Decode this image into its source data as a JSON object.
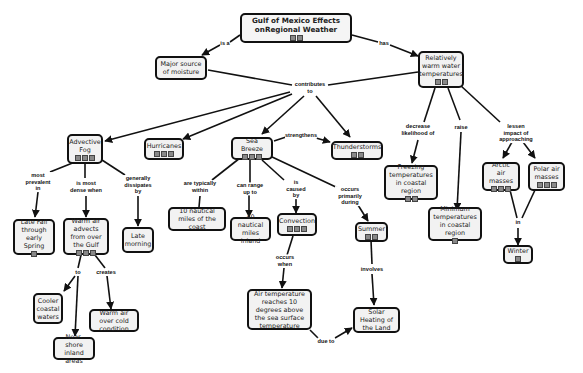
{
  "title": "Gulf of Mexico Effects onRegional Weather",
  "nodes": {
    "root": "Gulf of Mexico Effects onRegional Weather",
    "moisture": "Major source of moisture",
    "warm_water": "Relatively warm water temperatures",
    "fog": "Advective Fog",
    "hurricanes": "Hurricanes",
    "sea_breeze": "Sea Breeze",
    "thunderstorms": "Thunderstorms",
    "freezing": "Freezing temperatures in coastal region",
    "minimum": "Minimum temperatures in coastal region",
    "arctic": "Arctic air masses",
    "polar": "Polar air masses",
    "winter": "Winter",
    "late_fall": "Late Fall through early Spring",
    "warm_air": "Warm air advects from over the Gulf",
    "late_morning": "Late morning",
    "ten_nm": "10 nautical miles of the coast",
    "forty_nm": "40 nautical miles inland",
    "convection": "Convection",
    "summer": "Summer",
    "cooler": "Cooler coastal waters",
    "nearshore": "Near-shore inland areas",
    "warm_over_cold": "Warm air over cold condition",
    "air_temp": "Air temperature reaches 10 degrees above the sea surface temperature",
    "solar": "Solar Heating of the Land"
  },
  "links": {
    "is_a": "is a",
    "has": "has",
    "contributes_to": "contributes to",
    "strengthens": "strengthens",
    "decrease": "decrease likelihood of",
    "raise": "raise",
    "lessen": "lessen impact of approaching",
    "in": "in",
    "most_prevalent": "most prevalent in",
    "most_dense": "is most dense when",
    "dissipates": "generally dissipates by",
    "typically_within": "are typically within",
    "range_up": "can range up to",
    "caused_by": "is caused by",
    "occurs_during": "occurs primarily during",
    "to": "to",
    "creates": "creates",
    "occurs_when": "occurs when",
    "involves": "involves",
    "due_to": "due to"
  },
  "node_icons": {
    "root": [
      "doc-icon",
      "concept-map-icon"
    ],
    "warm_water": [
      "image-icon",
      "concept-map-icon"
    ],
    "fog": [
      "image-icon",
      "doc-icon",
      "concept-map-icon"
    ],
    "hurricanes": [
      "image-icon",
      "doc-icon",
      "concept-map-icon"
    ],
    "sea_breeze": [
      "image-icon",
      "doc-icon",
      "concept-map-icon"
    ],
    "thunderstorms": [
      "doc-icon",
      "concept-map-icon"
    ],
    "freezing": [
      "doc-icon",
      "concept-map-icon"
    ],
    "minimum": [
      "image-icon"
    ],
    "arctic": [
      "image-icon",
      "doc-icon",
      "concept-map-icon"
    ],
    "polar": [
      "image-icon",
      "doc-icon",
      "concept-map-icon"
    ],
    "winter": [
      "concept-map-icon"
    ],
    "late_fall": [
      "concept-map-icon"
    ],
    "warm_air": [
      "image-icon",
      "doc-icon",
      "concept-map-icon"
    ],
    "convection": [
      "image-icon",
      "doc-icon",
      "concept-map-icon"
    ],
    "summer": [
      "doc-icon",
      "concept-map-icon"
    ]
  }
}
